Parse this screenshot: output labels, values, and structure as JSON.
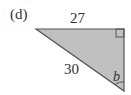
{
  "part_label": "(d)",
  "triangle": {
    "type": "right-triangle",
    "fill": "#c0c0c0",
    "stroke": "#555555",
    "vertices": {
      "top_left": [
        36,
        29
      ],
      "top_right": [
        124,
        29
      ],
      "bottom_right": [
        124,
        91
      ]
    },
    "right_angle_at": "top_right",
    "side_top_label": "27",
    "hypotenuse_label": "30",
    "angle_label": "b"
  }
}
